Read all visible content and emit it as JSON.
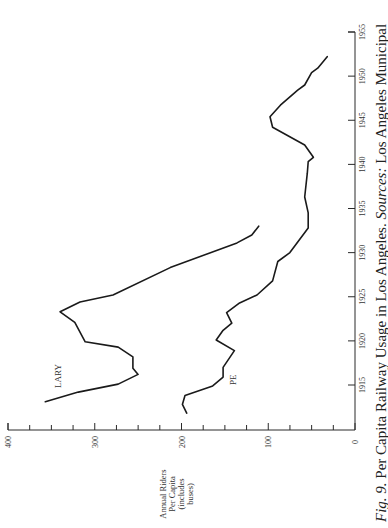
{
  "chart_data": {
    "type": "line",
    "orientation": "rotated-90-ccw",
    "title": "Fig. 9. Per Capita Railway Usage in Los Angeles. Sources: Los Angeles Municipal",
    "xlabel": "",
    "ylabel": "Annual Riders Per Capita (includes buses)",
    "xlim": [
      1910,
      1955
    ],
    "ylim": [
      0,
      400
    ],
    "x_ticks": [
      1915,
      1920,
      1925,
      1930,
      1935,
      1940,
      1945,
      1950,
      1955
    ],
    "y_ticks": [
      0,
      100,
      200,
      300,
      400
    ],
    "y_minor_tick_step": 25,
    "grid": false,
    "legend": "inline labels",
    "series": [
      {
        "name": "LARY",
        "x": [
          1913.1,
          1914.2,
          1915.1,
          1916.2,
          1916.9,
          1918.2,
          1919.3,
          1919.9,
          1922.1,
          1923.3,
          1924.4,
          1925.2,
          1928.3,
          1931.1,
          1932.0,
          1933.0
        ],
        "values": [
          357,
          319,
          273,
          250,
          256,
          256,
          273,
          311,
          323,
          340,
          317,
          279,
          213,
          136,
          119,
          111
        ]
      },
      {
        "name": "PE",
        "x": [
          1911.8,
          1912.8,
          1913.8,
          1914.9,
          1915.9,
          1917.0,
          1918.9,
          1920.1,
          1921.2,
          1922.0,
          1923.2,
          1924.3,
          1925.2,
          1926.8,
          1929.0,
          1930.0,
          1932.8,
          1934.5,
          1936.3,
          1939.0,
          1940.3,
          1940.8,
          1942.2,
          1944.2,
          1945.4,
          1946.7,
          1948.4,
          1949.0,
          1950.4,
          1950.9,
          1952.2
        ],
        "values": [
          194,
          199,
          196,
          164,
          152,
          152,
          139,
          160,
          152,
          142,
          148,
          133,
          113,
          95,
          89,
          75,
          54,
          54,
          58,
          55,
          54,
          48,
          58,
          95,
          98,
          86,
          66,
          58,
          50,
          43,
          32
        ]
      }
    ]
  },
  "figure": {
    "ylabel_lines": [
      "Annual Riders",
      "Per Capita",
      "(includes",
      "buses)"
    ],
    "series_labels": {
      "LARY": "LARY",
      "PE": "PE"
    },
    "caption": {
      "fig_label": "Fig. 9.",
      "text": " Per Capita Railway Usage in Los Angeles. ",
      "sources_label": "Sources:",
      "sources_text": " Los Angeles Municipal"
    }
  }
}
